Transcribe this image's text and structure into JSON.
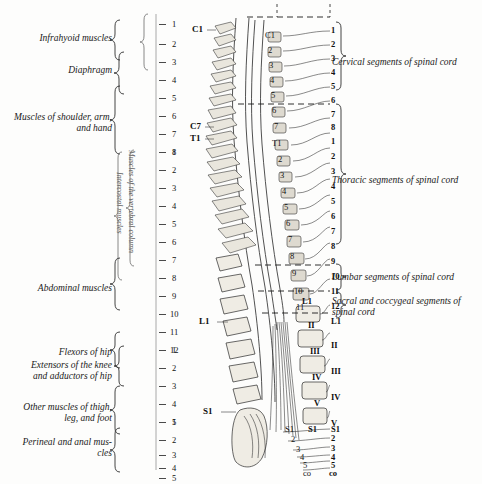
{
  "figure": {
    "background_color": "#fdfdfc",
    "ink_color": "#1c1c1c"
  },
  "left_labels": [
    {
      "text": "Infrahyoid muscles",
      "y": 38
    },
    {
      "text": "Diaphragm",
      "y": 70
    },
    {
      "text": "Muscles of shoulder, arm,\nand hand",
      "y": 118
    },
    {
      "text": "Abdominal muscles",
      "y": 288
    },
    {
      "text": "Flexors of hip",
      "y": 354
    },
    {
      "text": "Extensors of the knee\nand adductors of hip",
      "y": 370
    },
    {
      "text": "Other muscles of thigh,\nleg, and foot",
      "y": 408
    },
    {
      "text": "Perineal and anal mus-\ncles",
      "y": 443
    }
  ],
  "left_vertical_labels": [
    {
      "text": "Muscles of the vertebral column"
    },
    {
      "text": "Intercostal muscles"
    }
  ],
  "left_scale": {
    "groups": [
      {
        "name": "cervical",
        "numbers": [
          "1",
          "2",
          "3",
          "4",
          "5",
          "6",
          "7",
          "8"
        ]
      },
      {
        "name": "thoracic",
        "numbers": [
          "1",
          "2",
          "3",
          "4",
          "5",
          "6",
          "7",
          "8",
          "9",
          "10",
          "11",
          "12"
        ]
      },
      {
        "name": "lumbar",
        "numbers": [
          "1",
          "2",
          "3",
          "4",
          "5"
        ]
      },
      {
        "name": "sacral",
        "numbers": [
          "1",
          "2",
          "3",
          "4",
          "5"
        ]
      }
    ]
  },
  "right_labels": [
    {
      "text": "Cervical segments of spinal cord",
      "y": 62
    },
    {
      "text": "Thoracic segments of spinal cord",
      "y": 180
    },
    {
      "text": "Lumbar segments of spinal cord",
      "y": 277
    },
    {
      "text": "Sacral and coccygeal segments of\nspinal cord",
      "y": 302
    }
  ],
  "right_scale": {
    "cervical": [
      "1",
      "2",
      "3",
      "4",
      "5",
      "6",
      "7",
      "8"
    ],
    "thoracic": [
      "1",
      "2",
      "3",
      "4",
      "5",
      "6",
      "7",
      "8",
      "9",
      "10",
      "11",
      "12"
    ],
    "lumbar_vertebrae": [
      "L1",
      "II",
      "III",
      "IV",
      "V"
    ],
    "sacral": [
      "S1",
      "2",
      "3",
      "4",
      "5",
      "co"
    ]
  },
  "spine_markers": {
    "outer_left": [
      "C1",
      "C7",
      "T1",
      "L1",
      "S1"
    ],
    "inner_cord": [
      "C1",
      "2",
      "3",
      "4",
      "5",
      "6",
      "7",
      "T1",
      "2",
      "3",
      "4",
      "5",
      "6",
      "7",
      "8",
      "9",
      "10",
      "11",
      "12",
      "L1"
    ],
    "vertebral_bodies": [
      "L1",
      "II",
      "III",
      "IV",
      "V",
      "S1"
    ]
  }
}
